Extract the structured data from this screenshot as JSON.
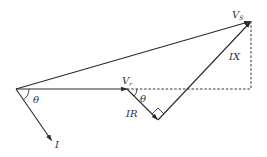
{
  "diagram": {
    "colors": {
      "line": "#2a2a2a",
      "text": "#333333",
      "background": "#ffffff"
    },
    "labels": {
      "vs_main": "V",
      "vs_sub": "S",
      "vr_main": "V",
      "vr_sub": "r",
      "ix": "IX",
      "ir": "IR",
      "current": "I",
      "theta_origin": "θ",
      "theta_vr": "θ"
    },
    "points": {
      "origin": [
        16,
        89
      ],
      "vr_tip": [
        127,
        89
      ],
      "ir_tip": [
        158,
        120
      ],
      "vs_tip": [
        251,
        21
      ],
      "i_tip": [
        52,
        141
      ],
      "dash_corner": [
        251,
        89
      ]
    },
    "vectors": [
      {
        "name": "Vs",
        "from": "origin",
        "to": "vs_tip"
      },
      {
        "name": "Vr",
        "from": "origin",
        "to": "vr_tip"
      },
      {
        "name": "IR",
        "from": "vr_tip",
        "to": "ir_tip"
      },
      {
        "name": "IX",
        "from": "ir_tip",
        "to": "vs_tip"
      },
      {
        "name": "I",
        "from": "origin",
        "to": "i_tip"
      }
    ],
    "dashed_lines": [
      {
        "from": "vr_tip",
        "to": "dash_corner"
      },
      {
        "from": "vs_tip",
        "to": "dash_corner"
      }
    ],
    "annotations": [
      "right-angle marker between IR and IX",
      "angle θ between Vr and I",
      "angle θ between horizontal and IR"
    ]
  }
}
